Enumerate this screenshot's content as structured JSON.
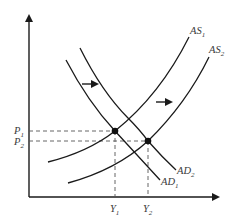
{
  "diagram": {
    "type": "AS-AD model",
    "axes": {
      "x_label": "",
      "y_label": ""
    },
    "curves": {
      "as1": {
        "base": "AS",
        "sub": "1"
      },
      "as2": {
        "base": "AS",
        "sub": "2"
      },
      "ad1": {
        "base": "AD",
        "sub": "1"
      },
      "ad2": {
        "base": "AD",
        "sub": "2"
      }
    },
    "price_levels": {
      "p1": {
        "base": "P",
        "sub": "1"
      },
      "p2": {
        "base": "P",
        "sub": "2"
      }
    },
    "outputs": {
      "y1": {
        "base": "Y",
        "sub": "1"
      },
      "y2": {
        "base": "Y",
        "sub": "2"
      }
    },
    "equilibria": [
      {
        "name": "initial",
        "curves": [
          "AS1",
          "AD1"
        ],
        "price": "P1",
        "output": "Y1"
      },
      {
        "name": "new",
        "curves": [
          "AS2",
          "AD2"
        ],
        "price": "P2",
        "output": "Y2"
      }
    ],
    "shifts": [
      {
        "curve": "AD",
        "direction": "right"
      },
      {
        "curve": "AS",
        "direction": "right"
      }
    ],
    "colors": {
      "line": "#1a1a1a",
      "label": "#3a3a3a",
      "dashed": "#555555"
    }
  }
}
